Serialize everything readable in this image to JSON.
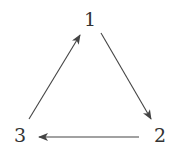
{
  "diagram": {
    "type": "directed-cycle",
    "colors": {
      "stroke": "#444444",
      "text": "#333333",
      "background": "#ffffff"
    },
    "nodes": [
      {
        "id": "1",
        "label": "1",
        "x": 90,
        "y": 19
      },
      {
        "id": "2",
        "label": "2",
        "x": 160,
        "y": 135
      },
      {
        "id": "3",
        "label": "3",
        "x": 20,
        "y": 135
      }
    ],
    "edges": [
      {
        "from": "1",
        "to": "2",
        "x1": 101,
        "y1": 33,
        "x2": 151,
        "y2": 119
      },
      {
        "from": "2",
        "to": "3",
        "x1": 139,
        "y1": 137,
        "x2": 39,
        "y2": 137
      },
      {
        "from": "3",
        "to": "1",
        "x1": 29,
        "y1": 119,
        "x2": 80,
        "y2": 35
      }
    ]
  }
}
